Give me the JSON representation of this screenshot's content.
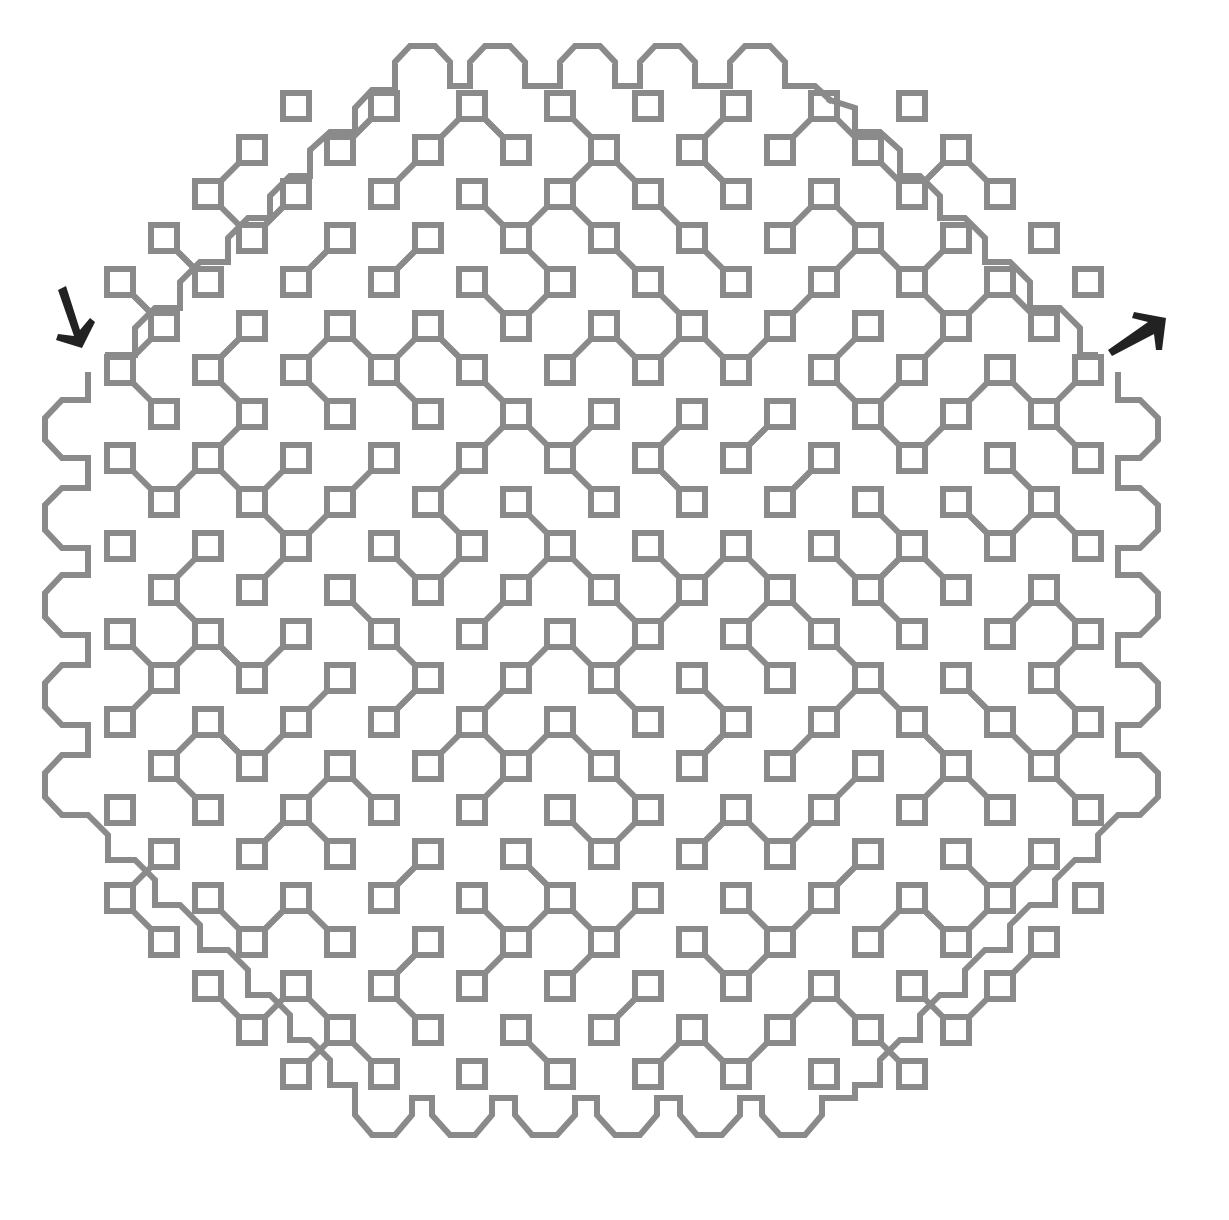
{
  "puzzle": {
    "type": "maze",
    "shape": "octagon",
    "colors": {
      "wall": "#8a8a8a",
      "arrow": "#222222",
      "background": "#ffffff"
    },
    "entrance": {
      "icon": "arrow-down-right-icon",
      "label": ""
    },
    "exit": {
      "icon": "arrow-up-right-icon",
      "label": ""
    }
  }
}
